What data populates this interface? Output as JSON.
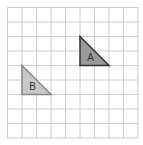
{
  "grid": {
    "columns": 9,
    "rows": 9,
    "origin_x": 7.5,
    "origin_y": 7.5,
    "cell_size": 14.5,
    "line_color": "#cccccc"
  },
  "shapes": [
    {
      "label": "A",
      "points": [
        [
          5,
          2
        ],
        [
          5,
          4
        ],
        [
          7,
          4
        ]
      ],
      "fill": "#9a9a9a",
      "stroke": "#333333"
    },
    {
      "label": "B",
      "points": [
        [
          1,
          4
        ],
        [
          1,
          6
        ],
        [
          3,
          6
        ]
      ],
      "fill": "#c8c8c8",
      "stroke": "#888888"
    }
  ]
}
